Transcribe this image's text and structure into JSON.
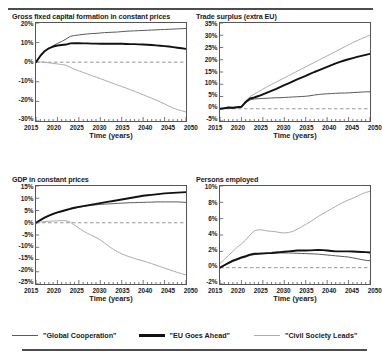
{
  "figure": {
    "xaxis_title": "Time (years)",
    "x_ticks": [
      "2015",
      "2020",
      "2025",
      "2030",
      "2035",
      "2040",
      "2045",
      "2050"
    ]
  },
  "legend": {
    "items": [
      {
        "label": "\"Global Cooperation\"",
        "color": "#5a5a5a",
        "key": "global_cooperation"
      },
      {
        "label": "\"EU Goes Ahead\"",
        "color": "#111111",
        "key": "eu_goes_ahead"
      },
      {
        "label": "\"Civil Society Leads\"",
        "color": "#adadad",
        "key": "civil_society_leads"
      }
    ]
  },
  "chart_data": [
    {
      "type": "line",
      "id": "gross-fixed-capital-formation",
      "title": "Gross fixed capital formation in constant prices",
      "xlabel": "Time (years)",
      "ylabel": "",
      "xlim": [
        2015,
        2050
      ],
      "ylim": [
        -30,
        20
      ],
      "y_ticks": [
        "20%",
        "10%",
        "0%",
        "-10%",
        "-20%",
        "-30%"
      ],
      "y_tick_values": [
        20,
        10,
        0,
        -10,
        -20,
        -30
      ],
      "x_ticks": [
        "2015",
        "2020",
        "2025",
        "2030",
        "2035",
        "2040",
        "2045",
        "2050"
      ],
      "grid": false,
      "zero_line": true,
      "x": [
        2015,
        2016,
        2017,
        2018,
        2019,
        2020,
        2021,
        2022,
        2023,
        2024,
        2025,
        2026,
        2027,
        2028,
        2029,
        2030,
        2031,
        2032,
        2033,
        2034,
        2035,
        2036,
        2037,
        2038,
        2039,
        2040,
        2041,
        2042,
        2043,
        2044,
        2045,
        2046,
        2047,
        2048,
        2049,
        2050
      ],
      "series": [
        {
          "name": "\"Global Cooperation\"",
          "color": "#5a5a5a",
          "values": [
            0,
            3.0,
            5.4,
            7.0,
            8.4,
            9.6,
            10.6,
            11.8,
            13.2,
            13.6,
            13.9,
            14.2,
            14.4,
            14.6,
            14.7,
            14.9,
            15.1,
            15.2,
            15.3,
            15.4,
            15.6,
            15.8,
            15.9,
            16.0,
            16.1,
            16.2,
            16.3,
            16.4,
            16.5,
            16.6,
            16.7,
            16.8,
            16.9,
            17.0,
            17.1,
            17.2
          ]
        },
        {
          "name": "\"EU Goes Ahead\"",
          "color": "#111111",
          "values": [
            0,
            3.2,
            5.6,
            7.1,
            8.0,
            8.5,
            8.8,
            9.0,
            9.6,
            9.7,
            9.7,
            9.6,
            9.6,
            9.5,
            9.5,
            9.4,
            9.4,
            9.4,
            9.4,
            9.5,
            9.4,
            9.3,
            9.2,
            9.2,
            9.1,
            9.0,
            8.9,
            8.8,
            8.6,
            8.4,
            8.2,
            8.0,
            7.7,
            7.4,
            7.1,
            6.8
          ]
        },
        {
          "name": "\"Civil Society Leads\"",
          "color": "#adadad",
          "values": [
            0,
            0.1,
            0.0,
            -0.3,
            -0.6,
            -0.9,
            -1.2,
            -1.5,
            -2.6,
            -3.6,
            -4.4,
            -5.2,
            -6.0,
            -6.8,
            -7.6,
            -8.4,
            -9.2,
            -10.0,
            -10.8,
            -11.6,
            -12.4,
            -13.2,
            -14.0,
            -14.9,
            -15.7,
            -16.6,
            -17.5,
            -18.4,
            -19.3,
            -20.3,
            -21.3,
            -22.4,
            -23.4,
            -24.2,
            -24.8,
            -25.4
          ]
        }
      ]
    },
    {
      "type": "line",
      "id": "trade-surplus-extra-eu",
      "title": "Trade surplus (extra EU)",
      "xlabel": "Time (years)",
      "ylabel": "",
      "xlim": [
        2015,
        2050
      ],
      "ylim": [
        -5,
        35
      ],
      "y_ticks": [
        "35%",
        "30%",
        "25%",
        "20%",
        "15%",
        "10%",
        "5%",
        "0%",
        "-5%"
      ],
      "y_tick_values": [
        35,
        30,
        25,
        20,
        15,
        10,
        5,
        0,
        -5
      ],
      "x_ticks": [
        "2015",
        "2020",
        "2025",
        "2030",
        "2035",
        "2040",
        "2045",
        "2050"
      ],
      "grid": false,
      "zero_line": true,
      "x": [
        2015,
        2016,
        2017,
        2018,
        2019,
        2020,
        2021,
        2022,
        2023,
        2024,
        2025,
        2026,
        2027,
        2028,
        2029,
        2030,
        2031,
        2032,
        2033,
        2034,
        2035,
        2036,
        2037,
        2038,
        2039,
        2040,
        2041,
        2042,
        2043,
        2044,
        2045,
        2046,
        2047,
        2048,
        2049,
        2050
      ],
      "series": [
        {
          "name": "\"Global Cooperation\"",
          "color": "#5a5a5a",
          "values": [
            0,
            0.2,
            0.4,
            0.3,
            0.5,
            0.6,
            2.4,
            3.6,
            4.0,
            4.1,
            4.2,
            4.3,
            4.4,
            4.5,
            4.5,
            4.6,
            4.7,
            4.8,
            4.9,
            5.0,
            5.1,
            5.3,
            5.6,
            5.8,
            6.0,
            6.1,
            6.2,
            6.3,
            6.4,
            6.4,
            6.5,
            6.6,
            6.7,
            6.8,
            6.9,
            6.9
          ]
        },
        {
          "name": "\"EU Goes Ahead\"",
          "color": "#111111",
          "values": [
            0,
            0.2,
            0.5,
            0.4,
            0.6,
            0.8,
            2.8,
            4.2,
            4.6,
            5.2,
            5.9,
            6.6,
            7.3,
            8.0,
            8.8,
            9.6,
            10.4,
            11.2,
            12.0,
            12.7,
            13.4,
            14.2,
            15.0,
            15.7,
            16.4,
            17.1,
            17.8,
            18.5,
            19.1,
            19.7,
            20.2,
            20.7,
            21.2,
            21.6,
            22.0,
            22.4
          ]
        },
        {
          "name": "\"Civil Society Leads\"",
          "color": "#adadad",
          "values": [
            0,
            0.3,
            0.6,
            0.5,
            0.8,
            1.0,
            3.2,
            5.0,
            6.0,
            7.0,
            8.0,
            9.0,
            9.9,
            10.8,
            11.7,
            12.6,
            13.5,
            14.4,
            15.3,
            16.2,
            17.1,
            18.0,
            18.9,
            19.8,
            20.7,
            21.6,
            22.5,
            23.4,
            24.3,
            25.2,
            26.1,
            27.0,
            27.8,
            28.6,
            29.3,
            30.0
          ]
        }
      ]
    },
    {
      "type": "line",
      "id": "gdp-constant-prices",
      "title": "GDP in constant prices",
      "xlabel": "Time (years)",
      "ylabel": "",
      "xlim": [
        2015,
        2050
      ],
      "ylim": [
        -25,
        15
      ],
      "y_ticks": [
        "15%",
        "10%",
        "5%",
        "0%",
        "-5%",
        "-10%",
        "-15%",
        "-20%",
        "-25%"
      ],
      "y_tick_values": [
        15,
        10,
        5,
        0,
        -5,
        -10,
        -15,
        -20,
        -25
      ],
      "x_ticks": [
        "2015",
        "2020",
        "2025",
        "2030",
        "2035",
        "2040",
        "2045",
        "2050"
      ],
      "grid": false,
      "zero_line": true,
      "x": [
        2015,
        2016,
        2017,
        2018,
        2019,
        2020,
        2021,
        2022,
        2023,
        2024,
        2025,
        2026,
        2027,
        2028,
        2029,
        2030,
        2031,
        2032,
        2033,
        2034,
        2035,
        2036,
        2037,
        2038,
        2039,
        2040,
        2041,
        2042,
        2043,
        2044,
        2045,
        2046,
        2047,
        2048,
        2049,
        2050
      ],
      "series": [
        {
          "name": "\"Global Cooperation\"",
          "color": "#5a5a5a",
          "values": [
            0,
            1.0,
            2.0,
            2.8,
            3.5,
            4.1,
            4.6,
            5.1,
            5.6,
            6.0,
            6.3,
            6.6,
            6.9,
            7.1,
            7.3,
            7.5,
            7.6,
            7.7,
            7.8,
            7.9,
            8.0,
            8.1,
            8.2,
            8.2,
            8.3,
            8.3,
            8.4,
            8.4,
            8.5,
            8.5,
            8.5,
            8.5,
            8.5,
            8.5,
            8.4,
            8.3
          ]
        },
        {
          "name": "\"EU Goes Ahead\"",
          "color": "#111111",
          "values": [
            0,
            1.1,
            2.1,
            2.9,
            3.6,
            4.2,
            4.7,
            5.2,
            5.7,
            6.1,
            6.5,
            6.8,
            7.1,
            7.4,
            7.7,
            8.0,
            8.3,
            8.6,
            8.9,
            9.2,
            9.5,
            9.8,
            10.1,
            10.4,
            10.7,
            11.0,
            11.2,
            11.4,
            11.6,
            11.8,
            12.0,
            12.1,
            12.2,
            12.3,
            12.4,
            12.5
          ]
        },
        {
          "name": "\"Civil Society Leads\"",
          "color": "#adadad",
          "values": [
            0,
            0.3,
            0.5,
            0.6,
            0.7,
            0.8,
            0.9,
            0.8,
            0.2,
            -1.0,
            -2.2,
            -3.3,
            -4.3,
            -5.2,
            -6.0,
            -7.0,
            -8.3,
            -9.6,
            -10.8,
            -11.8,
            -12.7,
            -13.4,
            -14.0,
            -14.6,
            -15.1,
            -15.6,
            -16.1,
            -16.7,
            -17.3,
            -17.9,
            -18.5,
            -19.1,
            -19.7,
            -20.3,
            -20.8,
            -21.3
          ]
        }
      ]
    },
    {
      "type": "line",
      "id": "persons-employed",
      "title": "Persons employed",
      "xlabel": "Time (years)",
      "ylabel": "",
      "xlim": [
        2015,
        2050
      ],
      "ylim": [
        -2,
        10
      ],
      "y_ticks": [
        "10%",
        "8%",
        "6%",
        "4%",
        "2%",
        "0%",
        "-2%"
      ],
      "y_tick_values": [
        10,
        8,
        6,
        4,
        2,
        0,
        -2
      ],
      "x_ticks": [
        "2015",
        "2020",
        "2025",
        "2030",
        "2035",
        "2040",
        "2045",
        "2050"
      ],
      "grid": false,
      "zero_line": true,
      "x": [
        2015,
        2016,
        2017,
        2018,
        2019,
        2020,
        2021,
        2022,
        2023,
        2024,
        2025,
        2026,
        2027,
        2028,
        2029,
        2030,
        2031,
        2032,
        2033,
        2034,
        2035,
        2036,
        2037,
        2038,
        2039,
        2040,
        2041,
        2042,
        2043,
        2044,
        2045,
        2046,
        2047,
        2048,
        2049,
        2050
      ],
      "series": [
        {
          "name": "\"Global Cooperation\"",
          "color": "#5a5a5a",
          "values": [
            0,
            0.25,
            0.5,
            0.75,
            0.95,
            1.15,
            1.3,
            1.5,
            1.6,
            1.65,
            1.7,
            1.72,
            1.75,
            1.78,
            1.8,
            1.8,
            1.8,
            1.78,
            1.76,
            1.74,
            1.72,
            1.7,
            1.68,
            1.65,
            1.6,
            1.55,
            1.5,
            1.45,
            1.4,
            1.35,
            1.3,
            1.2,
            1.1,
            1.0,
            0.9,
            0.85
          ]
        },
        {
          "name": "\"EU Goes Ahead\"",
          "color": "#111111",
          "values": [
            0,
            0.3,
            0.6,
            0.85,
            1.05,
            1.25,
            1.4,
            1.6,
            1.7,
            1.72,
            1.75,
            1.78,
            1.8,
            1.85,
            1.9,
            1.95,
            2.0,
            2.05,
            2.1,
            2.1,
            2.1,
            2.12,
            2.15,
            2.18,
            2.15,
            2.1,
            2.05,
            2.0,
            2.0,
            2.0,
            2.0,
            1.98,
            1.95,
            1.92,
            1.9,
            1.85
          ]
        },
        {
          "name": "\"Civil Society Leads\"",
          "color": "#adadad",
          "values": [
            0.5,
            1.0,
            1.5,
            2.0,
            2.5,
            2.9,
            3.4,
            4.0,
            4.5,
            4.65,
            4.6,
            4.5,
            4.45,
            4.4,
            4.3,
            4.25,
            4.3,
            4.45,
            4.7,
            5.0,
            5.3,
            5.6,
            5.95,
            6.3,
            6.6,
            6.9,
            7.2,
            7.5,
            7.8,
            8.05,
            8.3,
            8.5,
            8.75,
            9.0,
            9.2,
            9.35
          ]
        }
      ]
    }
  ]
}
